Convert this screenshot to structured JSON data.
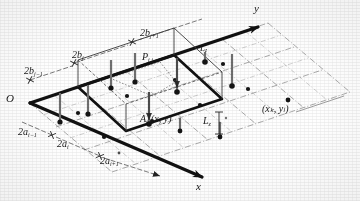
{
  "figure": {
    "type": "3d-isometric-grid-diagram",
    "background_color": "#fefefe",
    "ink_color": "#1a1a1a"
  },
  "axes": {
    "origin_label": "O",
    "y_axis_label": "y",
    "x_axis_label": "x",
    "y_arrow_direction": "upper-right",
    "x_arrow_direction": "lower-right"
  },
  "dimension_labels": {
    "b_row": [
      {
        "base": "2b",
        "sub": "j−1"
      },
      {
        "base": "2b",
        "sub": "j"
      },
      {
        "base": "2b",
        "sub": "j+1"
      }
    ],
    "a_row": [
      {
        "base": "2a",
        "sub": "i−1"
      },
      {
        "base": "2a",
        "sub": "i"
      },
      {
        "base": "2a",
        "sub": "i+1"
      }
    ]
  },
  "point_labels": {
    "panel_point": {
      "base": "A",
      "sub": "i,j",
      "coords": "(x , y )",
      "coords_plain": "(x, y)"
    },
    "field_point": {
      "base": "P",
      "sub": "i,j"
    },
    "rod_label_center": {
      "base": "L",
      "sub": "z"
    },
    "rod_label_upper": {
      "base": "L",
      "sub": "z"
    },
    "far_point_coords": "(x , y )",
    "far_point_coords_plain": "(xₖ, yₗ)"
  },
  "grid": {
    "columns": 5,
    "rows": 3,
    "line_style": "dash-dot",
    "cell_center_marker": "dot",
    "highlight_cell": "center cell with heavy outline",
    "rod_count": 10,
    "rod_terminal": "filled-circle"
  },
  "colors": {
    "ink": "#1a1a1a",
    "grid_line": "#7d7d7d",
    "heavy_line": "#111111",
    "rod": "#6f6f6f",
    "dot": "#141414"
  }
}
